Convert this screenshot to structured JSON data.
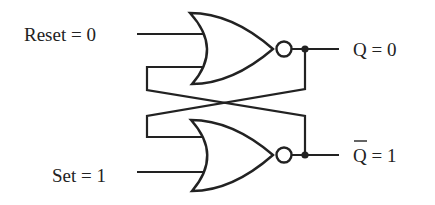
{
  "diagram": {
    "inputs": [
      {
        "name": "Reset",
        "value": "0",
        "label": "Reset = 0"
      },
      {
        "name": "Set",
        "value": "1",
        "label": "Set = 1"
      }
    ],
    "outputs": [
      {
        "name": "Q",
        "value": "0",
        "label_symbol": "Q",
        "label_rest": " = 0"
      },
      {
        "name": "Q-bar",
        "value": "1",
        "label_symbol": "Q",
        "label_rest": " = 1",
        "overbar": true
      }
    ],
    "gates": [
      {
        "type": "NOR",
        "inputs": [
          "Reset",
          "Q-bar"
        ],
        "output": "Q"
      },
      {
        "type": "NOR",
        "inputs": [
          "Set",
          "Q"
        ],
        "output": "Q-bar"
      }
    ],
    "colors": {
      "stroke": "#222222",
      "background": "#ffffff"
    }
  }
}
